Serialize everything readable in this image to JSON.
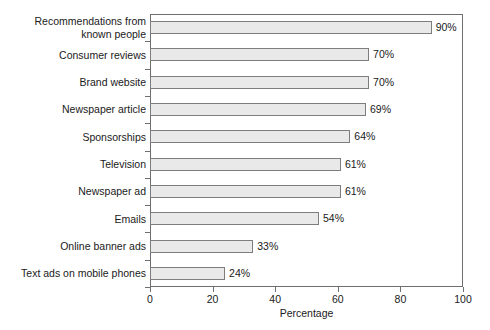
{
  "chart_data": {
    "type": "bar",
    "orientation": "horizontal",
    "title": "",
    "subtitle": "",
    "xlabel": "Percentage",
    "ylabel": "",
    "xlim": [
      0,
      100
    ],
    "xticks": [
      0,
      20,
      40,
      60,
      80,
      100
    ],
    "xtick_labels": [
      "0",
      "20",
      "40",
      "60",
      "80",
      "100"
    ],
    "grid": false,
    "legend": null,
    "bar_fill_color": "#e9e9e9",
    "bar_edge_color": "#7d7d7d",
    "axis_color": "#6f6f6f",
    "background_color": "#ffffff",
    "categories": [
      "Recommendations from\nknown people",
      "Consumer reviews",
      "Brand website",
      "Newspaper article",
      "Sponsorships",
      "Television",
      "Newspaper ad",
      "Emails",
      "Online banner ads",
      "Text ads on mobile phones"
    ],
    "values": [
      90,
      70,
      70,
      69,
      64,
      61,
      61,
      54,
      33,
      24
    ],
    "value_labels": [
      "90%",
      "70%",
      "70%",
      "69%",
      "64%",
      "61%",
      "61%",
      "54%",
      "33%",
      "24%"
    ]
  }
}
